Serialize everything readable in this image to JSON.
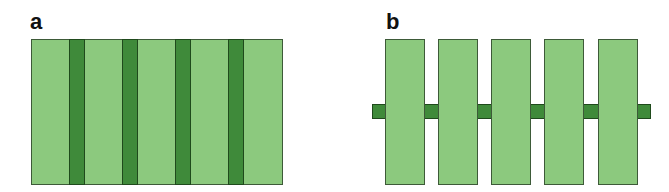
{
  "panels": [
    {
      "label": "a",
      "description": "Light green rectangle with four evenly spaced dark green vertical stripes spanning full height",
      "light_color": "#8cc97e",
      "dark_color": "#3f8a3a",
      "stripe_count": 4,
      "segment_count": 5
    },
    {
      "label": "b",
      "description": "Five separate light green vertical rectangles threaded on a thin dark green horizontal bar at mid-height",
      "light_color": "#8cc97e",
      "dark_color": "#3f8a3a",
      "rectangle_count": 5
    }
  ]
}
